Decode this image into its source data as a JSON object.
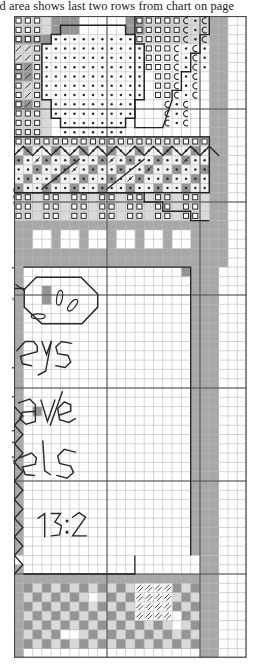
{
  "captions": {
    "top": "aded area shows last two rows from chart on page",
    "side": "Shaded area shows last two rows from chart on page 106."
  },
  "palette": {
    "white": "#ffffff",
    "pale": "#f2f2f2",
    "light_grey": "#d9d9d9",
    "mid_grey": "#a8a8a8",
    "grey": "#949494",
    "dark_grey": "#7d7d7d",
    "grid_line": "#b9b9b9",
    "grid_bold": "#4a4a4a",
    "outline": "#222222",
    "symbol": "#2b2b2b"
  },
  "grid": {
    "cell": 9.3,
    "cols": 25,
    "rows": 69,
    "bold_every": 10,
    "origin_x": 14,
    "origin_y": 16,
    "width": 234,
    "height": 646
  },
  "chart_data": {
    "type": "heatmap",
    "xlabel": "",
    "ylabel": "",
    "legend_position": "none",
    "grid": true,
    "symbol_key": [
      {
        "name": "open-square",
        "glyph": "square-outline",
        "meaning": "open square stitch symbol"
      },
      {
        "name": "crescent",
        "glyph": "c-shape",
        "meaning": "crescent / half-moon symbol"
      },
      {
        "name": "dot",
        "glyph": "dot",
        "meaning": "small filled dot symbol"
      },
      {
        "name": "slash",
        "glyph": "diagonal",
        "meaning": "diagonal slash symbol"
      },
      {
        "name": "double-slash",
        "glyph": "double-diagonal",
        "meaning": "hatched double slash symbol"
      }
    ],
    "shade_bands": [
      {
        "name": "shaded-column-band",
        "col_start": 20,
        "col_end": 22,
        "row_start": 0,
        "row_end": 57,
        "color": "#a8a8a8"
      },
      {
        "name": "battlement-band",
        "row_start": 19,
        "row_end": 25,
        "color": "#a8a8a8"
      },
      {
        "name": "left-margin-band",
        "col_start": 0,
        "col_end": 1,
        "row_start": 19,
        "row_end": 57,
        "color": "#a8a8a8"
      },
      {
        "name": "checkerboard-band",
        "row_start": 58,
        "row_end": 68,
        "colors": [
          "#949494",
          "#d9d9d9"
        ]
      }
    ],
    "backstitch_text_rows": [
      {
        "text": "eys",
        "row": 31,
        "col": 1
      },
      {
        "text": "ave",
        "row": 40,
        "col": 1
      },
      {
        "text": "els",
        "row": 47,
        "col": 1
      },
      {
        "text": "13:2",
        "row": 54,
        "col": 4
      }
    ],
    "motifs": [
      {
        "name": "face-oval",
        "row_start": 1,
        "row_end": 11,
        "col_start": 4,
        "col_end": 13
      },
      {
        "name": "zigzag-border",
        "row": 13,
        "col_start": 0,
        "col_end": 18
      },
      {
        "name": "stepped-block",
        "row_start": 0,
        "row_end": 12,
        "col_start": 13,
        "col_end": 21
      },
      {
        "name": "medallion-octagon",
        "row_start": 27,
        "row_end": 33,
        "col_start": 1,
        "col_end": 10
      },
      {
        "name": "left-zigzag-edge",
        "row_start": 42,
        "row_end": 60,
        "col_start": 0,
        "col_end": 2
      },
      {
        "name": "corner-hatch-block",
        "row_start": 61,
        "row_end": 65,
        "col_start": 13,
        "col_end": 17
      }
    ]
  }
}
